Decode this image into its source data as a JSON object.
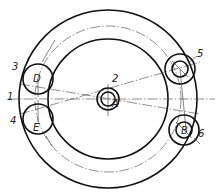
{
  "diagram": {
    "type": "technical-drawing",
    "labels": {
      "leader_1": "1",
      "leader_2": "2",
      "leader_3": "3",
      "leader_4": "4",
      "leader_5": "5",
      "leader_6": "6",
      "point_A": "A",
      "point_B": "B",
      "point_D": "D",
      "point_E": "E"
    },
    "colors": {
      "line": "#111111",
      "background": "#ffffff"
    }
  }
}
